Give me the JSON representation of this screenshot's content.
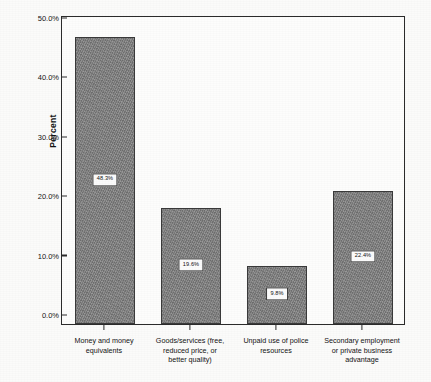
{
  "chart_data": {
    "type": "bar",
    "title": "",
    "xlabel": "",
    "ylabel": "Percent",
    "ylim": [
      0,
      52
    ],
    "grid": false,
    "legend": "none",
    "yticks": [
      "0.0%",
      "10.0%",
      "20.0%",
      "30.0%",
      "40.0%",
      "50.0%"
    ],
    "ytick_values": [
      0,
      10,
      20,
      30,
      40,
      50
    ],
    "categories": [
      "Money and money\nequivalents",
      "Goods/services (free,\nreduced price, or\nbetter quality)",
      "Unpaid use of police\nresources",
      "Secondary employment\nor private business\nadvantage"
    ],
    "values": [
      48.3,
      19.6,
      9.8,
      22.4
    ],
    "value_labels": [
      "48.3%",
      "19.6%",
      "9.8%",
      "22.4%"
    ],
    "bar_color": "#838383",
    "bar_edge_color": "#3a3a3a",
    "axis_color": "#2b2b2b",
    "background": "#fbfbfa"
  }
}
